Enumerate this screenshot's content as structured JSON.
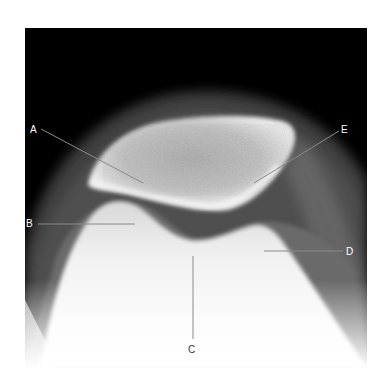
{
  "figure": {
    "type": "radiograph",
    "view": "knee patellofemoral skyline (axial) view",
    "background": "#ffffff",
    "line_color": "#8a8a8a",
    "labels": [
      {
        "id": "A",
        "text": "A",
        "x": 30,
        "y": 125
      },
      {
        "id": "B",
        "text": "B",
        "x": 26,
        "y": 219
      },
      {
        "id": "C",
        "text": "C",
        "x": 188,
        "y": 345
      },
      {
        "id": "D",
        "text": "D",
        "x": 346,
        "y": 247
      },
      {
        "id": "E",
        "text": "E",
        "x": 341,
        "y": 125
      }
    ]
  }
}
